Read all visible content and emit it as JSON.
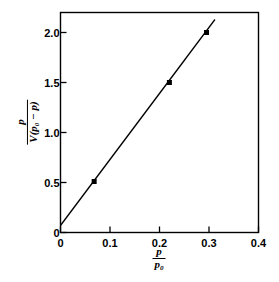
{
  "chart_data": {
    "type": "scatter",
    "title": "",
    "subtitle": "",
    "xlabel": "p / p0",
    "ylabel": "p / (V(p0 - p))",
    "xlabel_parts": {
      "numerator": "p",
      "denominator": "p",
      "denominator_sub": "0"
    },
    "ylabel_parts": {
      "numerator": "p",
      "denominator_pre": "V(p",
      "denominator_sub": "0",
      "denominator_post": " − p)"
    },
    "xlim": [
      0,
      0.4
    ],
    "ylim": [
      0,
      2.2
    ],
    "xticks": [
      0,
      0.1,
      0.2,
      0.3,
      0.4
    ],
    "yticks": [
      0,
      0.5,
      1.0,
      1.5,
      2.0
    ],
    "xtick_labels": [
      "0",
      "0.1",
      "0.2",
      "0.3",
      "0.4"
    ],
    "ytick_labels": [
      "0",
      "0.5",
      "1.0",
      "1.5",
      "2.0"
    ],
    "grid": false,
    "legend": null,
    "tick_direction": "in",
    "frame": true,
    "marker": "square",
    "marker_color": "#000000",
    "line_color": "#000000",
    "x": [
      0.068,
      0.22,
      0.295
    ],
    "y": [
      0.51,
      1.5,
      2.0
    ],
    "points": [
      {
        "x": 0.068,
        "y": 0.51
      },
      {
        "x": 0.22,
        "y": 1.5
      },
      {
        "x": 0.295,
        "y": 2.0
      }
    ],
    "fit_line": {
      "x_start": 0.0,
      "y_start": 0.07,
      "x_end": 0.312,
      "y_end": 2.13,
      "slope": 6.6,
      "intercept": 0.07
    }
  }
}
